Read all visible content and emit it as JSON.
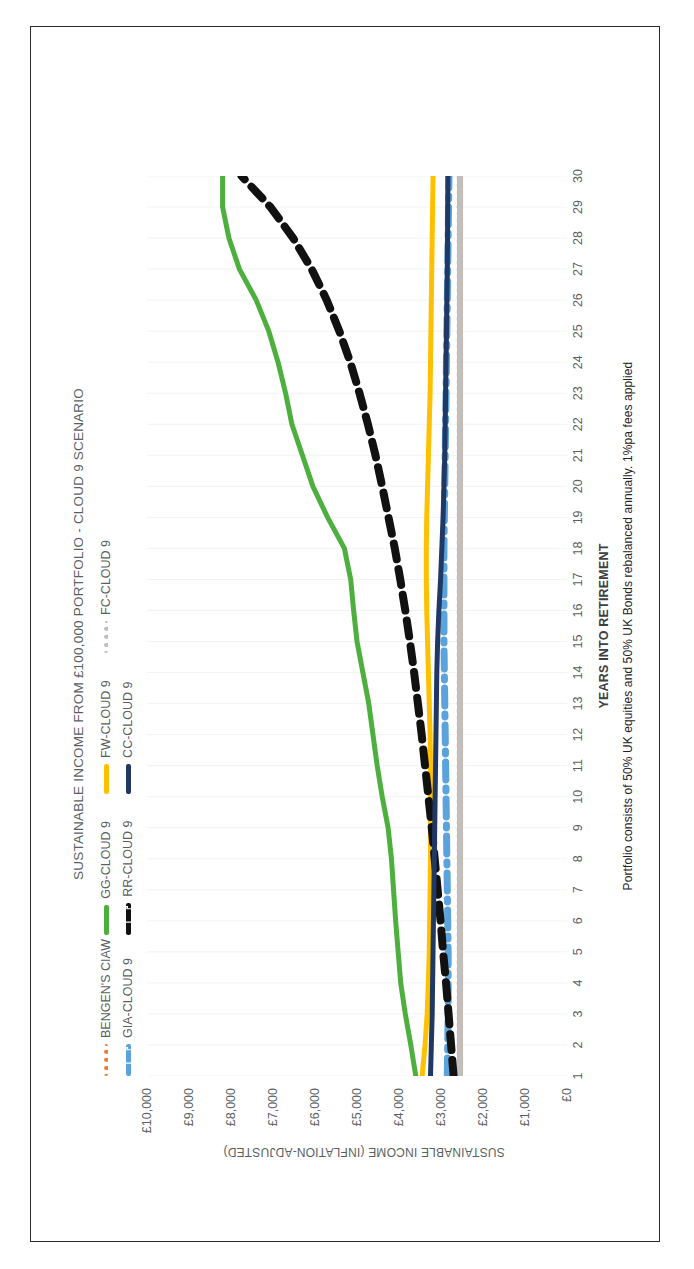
{
  "page": {
    "background": "#ffffff",
    "border_color": "#2b2b2b"
  },
  "chart_data": {
    "type": "line",
    "title": "SUSTAINABLE INCOME FROM £100,000 PORTFOLIO - CLOUD 9 SCENARIO",
    "xlabel": "YEARS INTO RETIREMENT",
    "ylabel": "SUSTAINABLE INCOME (INFLATION-ADJUSTED)",
    "footnote": "Portfolio consists of 50% UK equities and 50% UK Bonds rebalanced annually.  1%pa fees applied",
    "rotation_degrees": -90,
    "grid": "vertical-light",
    "legend_position": "top",
    "xlim": [
      1,
      30
    ],
    "ylim": [
      0,
      10000
    ],
    "yticks": [
      0,
      1000,
      2000,
      3000,
      4000,
      5000,
      6000,
      7000,
      8000,
      9000,
      10000
    ],
    "ytick_labels": [
      "£0",
      "£1,000",
      "£2,000",
      "£3,000",
      "£4,000",
      "£5,000",
      "£6,000",
      "£7,000",
      "£8,000",
      "£9,000",
      "£10,000"
    ],
    "x": [
      1,
      2,
      3,
      4,
      5,
      6,
      7,
      8,
      9,
      10,
      11,
      12,
      13,
      14,
      15,
      16,
      17,
      18,
      19,
      20,
      21,
      22,
      23,
      24,
      25,
      26,
      27,
      28,
      29,
      30
    ],
    "series": [
      {
        "name": "BENGEN'S CIAW",
        "color": "#ED7D31",
        "style": "dotted",
        "values": [
          2550,
          2550,
          2550,
          2550,
          2550,
          2550,
          2550,
          2550,
          2550,
          2550,
          2550,
          2550,
          2550,
          2550,
          2550,
          2550,
          2550,
          2550,
          2550,
          2550,
          2550,
          2550,
          2550,
          2550,
          2550,
          2550,
          2550,
          2550,
          2550,
          2550
        ]
      },
      {
        "name": "GG-CLOUD 9",
        "color": "#4CAF3E",
        "style": "solid",
        "values": [
          3600,
          3720,
          3850,
          3960,
          4020,
          4080,
          4130,
          4180,
          4260,
          4400,
          4520,
          4620,
          4720,
          4860,
          5000,
          5080,
          5150,
          5300,
          5700,
          6050,
          6300,
          6550,
          6700,
          6880,
          7100,
          7400,
          7800,
          8050,
          8200,
          8200
        ]
      },
      {
        "name": "FW-CLOUD 9",
        "color": "#FFC000",
        "style": "solid",
        "values": [
          3450,
          3380,
          3330,
          3300,
          3280,
          3270,
          3260,
          3250,
          3250,
          3250,
          3250,
          3260,
          3280,
          3300,
          3320,
          3340,
          3350,
          3350,
          3340,
          3320,
          3300,
          3280,
          3260,
          3250,
          3240,
          3230,
          3220,
          3210,
          3200,
          3190
        ]
      },
      {
        "name": "FC-CLOUD 9",
        "color": "#BFBFBF",
        "style": "dotted",
        "values": [
          2550,
          2550,
          2550,
          2550,
          2550,
          2550,
          2550,
          2550,
          2550,
          2550,
          2550,
          2550,
          2550,
          2550,
          2550,
          2550,
          2550,
          2550,
          2550,
          2550,
          2550,
          2550,
          2550,
          2550,
          2550,
          2550,
          2550,
          2550,
          2550,
          2550
        ]
      },
      {
        "name": "GIA-CLOUD 9",
        "color": "#5BA3DC",
        "style": "dashdot",
        "values": [
          2850,
          2840,
          2830,
          2830,
          2830,
          2840,
          2850,
          2860,
          2870,
          2880,
          2890,
          2900,
          2910,
          2920,
          2930,
          2930,
          2930,
          2930,
          2920,
          2910,
          2900,
          2890,
          2880,
          2870,
          2860,
          2850,
          2840,
          2830,
          2820,
          2810
        ]
      },
      {
        "name": "RR-CLOUD 9",
        "color": "#111111",
        "style": "dashed",
        "values": [
          2700,
          2760,
          2820,
          2880,
          2950,
          3010,
          3080,
          3150,
          3220,
          3300,
          3380,
          3460,
          3550,
          3640,
          3740,
          3850,
          3970,
          4100,
          4250,
          4400,
          4560,
          4740,
          4940,
          5160,
          5420,
          5720,
          6080,
          6520,
          7060,
          7750
        ]
      },
      {
        "name": "CC-CLOUD 9",
        "color": "#1F3864",
        "style": "solid",
        "values": [
          3250,
          3230,
          3210,
          3200,
          3190,
          3180,
          3170,
          3160,
          3150,
          3140,
          3130,
          3120,
          3110,
          3100,
          3080,
          3050,
          3010,
          2980,
          2950,
          2930,
          2910,
          2900,
          2890,
          2880,
          2870,
          2860,
          2850,
          2845,
          2840,
          2835
        ]
      }
    ]
  }
}
